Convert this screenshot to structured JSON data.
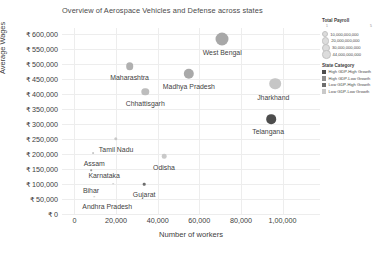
{
  "chart_data": {
    "type": "scatter",
    "title": "Overview of Aerospace Vehicles and Defense across states",
    "xlabel": "Number of workers",
    "ylabel": "Average Wages",
    "xlim": [
      -6000,
      118000
    ],
    "ylim": [
      0,
      620000
    ],
    "grid": true,
    "xticks": [
      "0",
      "20,000",
      "40,000",
      "60,000",
      "80,000",
      "1,00,000"
    ],
    "xtickvalues": [
      0,
      20000,
      40000,
      60000,
      80000,
      100000
    ],
    "yticks": [
      "₹ 0",
      "₹ 50,000",
      "₹ 100,000",
      "₹ 150,000",
      "₹ 200,000",
      "₹ 250,000",
      "₹ 300,000",
      "₹ 350,000",
      "₹ 400,000",
      "₹ 450,000",
      "₹ 500,000",
      "₹ 550,000",
      "₹ 600,000"
    ],
    "ytickvalues": [
      0,
      50000,
      100000,
      150000,
      200000,
      250000,
      300000,
      350000,
      400000,
      450000,
      500000,
      550000,
      600000
    ],
    "size_field": "Total Payroll",
    "color_field": "State Category",
    "points": [
      {
        "label": "West Bengal",
        "x": 71000,
        "y": 585000,
        "size": 13.0,
        "color": "#a8a8a8",
        "label_dx": 0,
        "label_dy": 10
      },
      {
        "label": "Maharashtra",
        "x": 26500,
        "y": 493000,
        "size": 7.6,
        "color": "#b0b0b0",
        "label_dx": 0,
        "label_dy": 8
      },
      {
        "label": "Madhya Pradesh",
        "x": 55000,
        "y": 467000,
        "size": 10.4,
        "color": "#a9a9a9",
        "label_dx": 0,
        "label_dy": 9
      },
      {
        "label": "Jharkhand",
        "x": 96500,
        "y": 435000,
        "size": 11.6,
        "color": "#c6c6c6",
        "label_dx": -2,
        "label_dy": 10
      },
      {
        "label": "Chhattisgarh",
        "x": 34000,
        "y": 407000,
        "size": 7.4,
        "color": "#bdbdbd",
        "label_dx": 0,
        "label_dy": 8
      },
      {
        "label": "Telangana",
        "x": 94500,
        "y": 316000,
        "size": 9.6,
        "color": "#4d4d4d",
        "label_dx": -3,
        "label_dy": 9
      },
      {
        "label": "Tamil Nadu",
        "x": 20000,
        "y": 250000,
        "size": 3.4,
        "color": "#c9c9c9",
        "label_dx": 0,
        "label_dy": 7
      },
      {
        "label": "Assam",
        "x": 9000,
        "y": 204000,
        "size": 1.8,
        "color": "#c9c9c9",
        "label_dx": 1,
        "label_dy": 7
      },
      {
        "label": "Odisha",
        "x": 43000,
        "y": 193000,
        "size": 4.6,
        "color": "#c9c9c9",
        "label_dx": 0,
        "label_dy": 8
      },
      {
        "label": "Karnataka",
        "x": 8000,
        "y": 146000,
        "size": 1.6,
        "color": "#9a9a9a",
        "label_dx": 13,
        "label_dy": 2
      },
      {
        "label": "Bihar",
        "x": 18500,
        "y": 101000,
        "size": 1.6,
        "color": "#c9c9c9",
        "label_dx": -22,
        "label_dy": 3
      },
      {
        "label": "Gujarat",
        "x": 33500,
        "y": 100000,
        "size": 2.6,
        "color": "#6e6e6e",
        "label_dx": 0,
        "label_dy": 7
      },
      {
        "label": "Andhra Pradesh",
        "x": 9500,
        "y": 58000,
        "size": 1.5,
        "color": "#c9c9c9",
        "label_dx": 13,
        "label_dy": 6
      }
    ]
  },
  "legend": {
    "size_legend": {
      "title": "Total Payroll",
      "axis_min": "1",
      "axis_max": "5",
      "entries": [
        {
          "label": "10,000,000,000",
          "diameter": 4.2
        },
        {
          "label": "20,000,000,000",
          "diameter": 5.2
        },
        {
          "label": "30,000,000,000",
          "diameter": 6.0
        },
        {
          "label": "44,000,000,000",
          "diameter": 6.6
        }
      ]
    },
    "category_legend": {
      "title": "State Category",
      "entries": [
        {
          "label": "High GDP-High Growth",
          "color": "#4d4d4d"
        },
        {
          "label": "High GDP-Low Growth",
          "color": "#8f8f8f"
        },
        {
          "label": "Low GDP-High Growth",
          "color": "#6e6e6e"
        },
        {
          "label": "Low GDP-Low Growth",
          "color": "#c9c9c9"
        }
      ]
    }
  }
}
